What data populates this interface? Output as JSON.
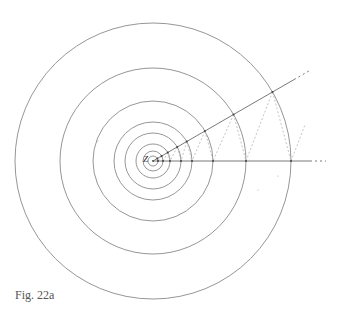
{
  "figure": {
    "caption": "Fig. 22a",
    "center_label": "Z",
    "center": [
      153,
      161
    ],
    "ring_radii": [
      5,
      10,
      17,
      28,
      39,
      60,
      93,
      138
    ],
    "ray_angle_deg": 30,
    "ray_length_solid": 165,
    "ray_length_dotted": 180,
    "horizontal_ray_solid_end": 312,
    "horizontal_ray_dotted_end": 326,
    "colors": {
      "ring": "#8a8a8a",
      "ray": "#6a6a6a",
      "dashed": "#b5b5b5",
      "point": "#444444"
    }
  }
}
